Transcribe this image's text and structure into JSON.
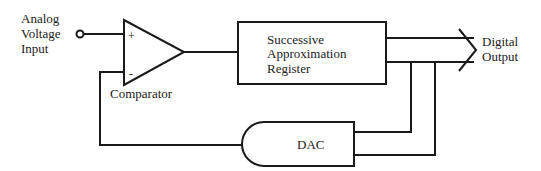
{
  "diagram": {
    "input": {
      "label_lines": [
        "Analog",
        "Voltage",
        "Input"
      ]
    },
    "comparator": {
      "label": "Comparator",
      "plus_symbol": "+",
      "minus_symbol": "-"
    },
    "sar": {
      "label_lines": [
        "Successive",
        "Approximation",
        "Register"
      ]
    },
    "dac": {
      "label": "DAC"
    },
    "output": {
      "label_lines": [
        "Digital",
        "Output"
      ]
    },
    "colors": {
      "stroke": "#1a1a1a",
      "text": "#222222",
      "background": "#ffffff"
    }
  }
}
